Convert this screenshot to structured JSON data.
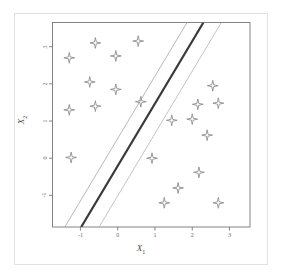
{
  "figure": {
    "title": "",
    "axis_color": "#777777",
    "frame_color": "#e2e2e2",
    "marker_color": "#8a8a8a",
    "boundary_color": "#3a3a3a",
    "margin_color": "#9a9a9a"
  },
  "axes": {
    "x_title": "X",
    "x_title_sub": "1",
    "y_title": "X",
    "y_title_sub": "2",
    "x_ticks": [
      "-1",
      "0",
      "1",
      "2",
      "3"
    ],
    "y_ticks": [
      "-1",
      "0",
      "1",
      "2",
      "3"
    ]
  },
  "chart_data": {
    "type": "scatter",
    "title": "",
    "xlabel": "X1",
    "ylabel": "X2",
    "xlim": [
      -1.75,
      3.55
    ],
    "ylim": [
      -1.85,
      3.65
    ],
    "xticks": [
      -1,
      0,
      1,
      2,
      3
    ],
    "yticks": [
      -1,
      0,
      1,
      2,
      3
    ],
    "grid": false,
    "legend": false,
    "marker": "4-pointed-star",
    "series": [
      {
        "name": "class-left",
        "points": [
          [
            -1.3,
            2.7
          ],
          [
            -0.6,
            3.1
          ],
          [
            -0.05,
            2.75
          ],
          [
            0.55,
            3.15
          ],
          [
            -0.75,
            2.05
          ],
          [
            -0.05,
            1.85
          ],
          [
            -1.3,
            1.3
          ],
          [
            -0.6,
            1.4
          ],
          [
            0.62,
            1.52
          ],
          [
            -1.25,
            0.02
          ]
        ]
      },
      {
        "name": "class-right",
        "points": [
          [
            2.55,
            1.95
          ],
          [
            2.15,
            1.45
          ],
          [
            2.7,
            1.48
          ],
          [
            1.45,
            1.02
          ],
          [
            2.0,
            1.05
          ],
          [
            2.4,
            0.62
          ],
          [
            0.92,
            0.0
          ],
          [
            2.18,
            -0.38
          ],
          [
            1.62,
            -0.8
          ],
          [
            1.25,
            -1.2
          ],
          [
            2.7,
            -1.2
          ]
        ]
      }
    ],
    "lines": [
      {
        "name": "decision-boundary",
        "type": "solid",
        "width": 2.2,
        "color": "#3a3a3a",
        "points": [
          [
            -0.98,
            -1.85
          ],
          [
            2.3,
            3.65
          ]
        ]
      },
      {
        "name": "margin-upper",
        "type": "solid",
        "width": 0.7,
        "color": "#9a9a9a",
        "points": [
          [
            -1.42,
            -1.85
          ],
          [
            1.86,
            3.65
          ]
        ]
      },
      {
        "name": "margin-lower",
        "type": "solid",
        "width": 0.7,
        "color": "#aaaaaa",
        "points": [
          [
            -0.5,
            -1.85
          ],
          [
            2.78,
            3.65
          ]
        ]
      }
    ]
  }
}
